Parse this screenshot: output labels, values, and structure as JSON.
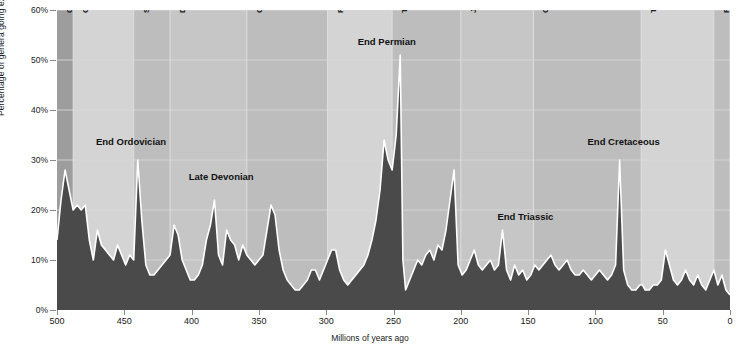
{
  "chart_data": {
    "type": "area",
    "title": "",
    "xlabel": "Millions of years ago",
    "ylabel": "Percentage of genera going extinct",
    "xlim": [
      500,
      0
    ],
    "ylim": [
      0,
      60
    ],
    "x_ticks": [
      500,
      450,
      400,
      350,
      300,
      250,
      200,
      150,
      100,
      50,
      0
    ],
    "y_ticks": [
      "0%",
      "10%",
      "20%",
      "30%",
      "40%",
      "50%",
      "60%"
    ],
    "y_tick_values": [
      0,
      10,
      20,
      30,
      40,
      50,
      60
    ],
    "grid": true,
    "legend": "none",
    "series_name": "Extinction intensity",
    "x": [
      500,
      497,
      494,
      491,
      488,
      485,
      482,
      479,
      476,
      473,
      470,
      467,
      464,
      461,
      458,
      455,
      452,
      449,
      446,
      443,
      440,
      437,
      434,
      431,
      428,
      425,
      422,
      419,
      416,
      413,
      410,
      407,
      404,
      401,
      398,
      395,
      392,
      389,
      386,
      383,
      380,
      377,
      374,
      371,
      368,
      365,
      362,
      359,
      356,
      353,
      350,
      347,
      344,
      341,
      338,
      335,
      332,
      329,
      326,
      323,
      320,
      317,
      314,
      311,
      308,
      305,
      302,
      299,
      296,
      293,
      290,
      287,
      284,
      281,
      278,
      275,
      272,
      269,
      266,
      263,
      260,
      257,
      254,
      251,
      248,
      245,
      243,
      241,
      238,
      235,
      232,
      229,
      226,
      223,
      220,
      217,
      214,
      211,
      208,
      205,
      202,
      199,
      196,
      193,
      190,
      187,
      184,
      181,
      178,
      175,
      172,
      169,
      166,
      163,
      160,
      157,
      154,
      151,
      148,
      145,
      142,
      139,
      136,
      133,
      130,
      127,
      124,
      121,
      118,
      115,
      112,
      109,
      106,
      103,
      100,
      97,
      94,
      91,
      88,
      85,
      82,
      79,
      76,
      73,
      70,
      67,
      65,
      63,
      60,
      57,
      54,
      51,
      48,
      45,
      42,
      39,
      36,
      33,
      30,
      27,
      24,
      21,
      18,
      15,
      12,
      9,
      6,
      3,
      0
    ],
    "y": [
      14,
      22,
      28,
      24,
      20,
      21,
      20,
      21,
      14,
      10,
      16,
      13,
      12,
      11,
      10,
      13,
      11,
      9,
      11,
      10,
      30,
      18,
      9,
      7,
      7,
      8,
      9,
      10,
      11,
      17,
      15,
      10,
      8,
      6,
      6,
      7,
      9,
      14,
      17,
      22,
      11,
      9,
      16,
      14,
      13,
      10,
      13,
      11,
      10,
      9,
      10,
      11,
      16,
      21,
      19,
      12,
      8,
      6,
      5,
      4,
      4,
      5,
      6,
      8,
      8,
      6,
      8,
      10,
      12,
      12,
      8,
      6,
      5,
      6,
      7,
      8,
      9,
      11,
      14,
      18,
      24,
      34,
      30,
      28,
      35,
      51,
      10,
      4,
      6,
      8,
      10,
      9,
      11,
      12,
      10,
      13,
      12,
      16,
      22,
      28,
      9,
      7,
      8,
      10,
      12,
      9,
      8,
      9,
      10,
      8,
      9,
      16,
      8,
      6,
      9,
      7,
      8,
      6,
      7,
      9,
      8,
      9,
      10,
      11,
      9,
      8,
      9,
      10,
      8,
      7,
      7,
      8,
      7,
      6,
      7,
      8,
      7,
      6,
      7,
      9,
      30,
      8,
      5,
      4,
      4,
      5,
      5,
      4,
      4,
      5,
      5,
      6,
      12,
      9,
      6,
      5,
      6,
      8,
      6,
      5,
      7,
      5,
      4,
      6,
      8,
      5,
      7,
      4,
      3
    ],
    "periods": [
      {
        "name": "Cambrian",
        "start": 500,
        "end": 488,
        "shade": "dark"
      },
      {
        "name": "Ordovician",
        "start": 488,
        "end": 443,
        "shade": "light"
      },
      {
        "name": "Silurian",
        "start": 443,
        "end": 416,
        "shade": "mid"
      },
      {
        "name": "Devonian",
        "start": 416,
        "end": 359,
        "shade": "midlight"
      },
      {
        "name": "Carboniferous",
        "start": 359,
        "end": 299,
        "shade": "mid"
      },
      {
        "name": "Permian",
        "start": 299,
        "end": 251,
        "shade": "light"
      },
      {
        "name": "Triassic",
        "start": 251,
        "end": 200,
        "shade": "mid"
      },
      {
        "name": "Jurassic",
        "start": 200,
        "end": 146,
        "shade": "midlight"
      },
      {
        "name": "Cretaceous",
        "start": 146,
        "end": 66,
        "shade": "mid"
      },
      {
        "name": "Tertiary",
        "start": 66,
        "end": 12,
        "shade": "light"
      },
      {
        "name": "Pleistogene",
        "start": 12,
        "end": 0,
        "shade": "mid"
      }
    ],
    "annotations": [
      {
        "label": "End Ordovician",
        "x": 445,
        "y": 33.5
      },
      {
        "label": "Late Devonian",
        "x": 378,
        "y": 26.5
      },
      {
        "label": "End Permian",
        "x": 255,
        "y": 53.5
      },
      {
        "label": "End Triassic",
        "x": 152,
        "y": 18.5
      },
      {
        "label": "End Cretaceous",
        "x": 79,
        "y": 33.5
      }
    ],
    "colors": {
      "area_fill": "#4a4a4a",
      "area_outline": "#ffffff",
      "band_light": "#d4d4d4",
      "band_midlight": "#c6c6c6",
      "band_mid": "#bdbdbd",
      "band_dark": "#9d9d9d",
      "grid": "#d9d9d9",
      "axis": "#8a8a8a",
      "text": "#1a1a1a"
    }
  }
}
